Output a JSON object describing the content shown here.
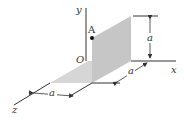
{
  "diagram": {
    "type": "3d-coordinate-figure",
    "axes": {
      "x_label": "x",
      "y_label": "y",
      "z_label": "z",
      "origin_label": "O"
    },
    "point": {
      "label": "A"
    },
    "dimensions": [
      {
        "id": "vertical-height",
        "label": "a"
      },
      {
        "id": "x-offset",
        "label": "a"
      },
      {
        "id": "z-width",
        "label": "a"
      }
    ],
    "colors": {
      "plate_vertical": "#c8c8c8",
      "plate_horizontal": "#d8d8d8",
      "lines": "#333333",
      "background": "#ffffff"
    }
  }
}
